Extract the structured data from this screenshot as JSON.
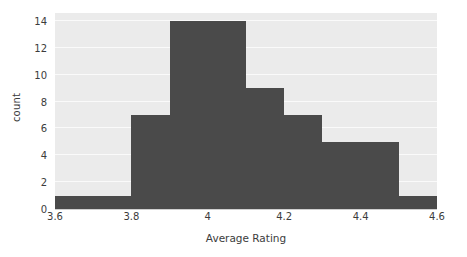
{
  "chart_data": {
    "type": "bar",
    "subtype": "histogram",
    "title": "",
    "xlabel": "Average Rating",
    "ylabel": "count",
    "xlim": [
      3.6,
      4.6
    ],
    "ylim": [
      0,
      14.6
    ],
    "bin_width": 0.1,
    "grid": true,
    "legend": false,
    "bar_color": "#4a4a4a",
    "plot_background": "#ebebeb",
    "gridline_color": "#fafafa",
    "text_color": "#3c3c3c",
    "xticks": [
      "3.6",
      "3.8",
      "4",
      "4.2",
      "4.4",
      "4.6"
    ],
    "xtick_values": [
      3.6,
      3.8,
      4.0,
      4.2,
      4.4,
      4.6
    ],
    "yticks": [
      "0",
      "2",
      "4",
      "6",
      "8",
      "10",
      "12",
      "14"
    ],
    "ytick_values": [
      0,
      2,
      4,
      6,
      8,
      10,
      12,
      14
    ],
    "bins": [
      {
        "start": 3.6,
        "end": 3.7,
        "count": 1
      },
      {
        "start": 3.7,
        "end": 3.8,
        "count": 1
      },
      {
        "start": 3.8,
        "end": 3.9,
        "count": 7
      },
      {
        "start": 3.9,
        "end": 4.0,
        "count": 14
      },
      {
        "start": 4.0,
        "end": 4.1,
        "count": 14
      },
      {
        "start": 4.1,
        "end": 4.2,
        "count": 9
      },
      {
        "start": 4.2,
        "end": 4.3,
        "count": 7
      },
      {
        "start": 4.3,
        "end": 4.4,
        "count": 5
      },
      {
        "start": 4.4,
        "end": 4.5,
        "count": 5
      },
      {
        "start": 4.5,
        "end": 4.6,
        "count": 1
      }
    ],
    "categories": [
      "3.6-3.7",
      "3.7-3.8",
      "3.8-3.9",
      "3.9-4.0",
      "4.0-4.1",
      "4.1-4.2",
      "4.2-4.3",
      "4.3-4.4",
      "4.4-4.5",
      "4.5-4.6"
    ],
    "values": [
      1,
      1,
      7,
      14,
      14,
      9,
      7,
      5,
      5,
      1
    ]
  }
}
